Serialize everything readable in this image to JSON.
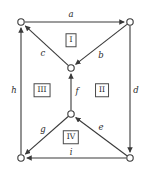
{
  "diagram": {
    "width": 148,
    "height": 172,
    "colors": {
      "stroke": "#3a3a3a",
      "background": "#ffffff",
      "text": "#2b2b2b",
      "box_border": "#4a4a4a"
    },
    "nodes": [
      {
        "id": "tl",
        "label": "",
        "x": 21,
        "y": 22,
        "r": 3.2
      },
      {
        "id": "tr",
        "label": "",
        "x": 130,
        "y": 22,
        "r": 3.2
      },
      {
        "id": "cu",
        "label": "",
        "x": 71,
        "y": 68,
        "r": 3.2
      },
      {
        "id": "cd",
        "label": "",
        "x": 71,
        "y": 114,
        "r": 3.2
      },
      {
        "id": "bl",
        "label": "",
        "x": 21,
        "y": 158,
        "r": 3.2
      },
      {
        "id": "br",
        "label": "",
        "x": 130,
        "y": 158,
        "r": 3.2
      }
    ],
    "edges": [
      {
        "id": "a",
        "label": "a",
        "from": "tl",
        "to": "tr",
        "label_x": 71,
        "label_y": 14
      },
      {
        "id": "b",
        "label": "b",
        "from": "tr",
        "to": "cu",
        "label_x": 101,
        "label_y": 55
      },
      {
        "id": "c",
        "label": "c",
        "from": "cu",
        "to": "tl",
        "label_x": 43,
        "label_y": 53
      },
      {
        "id": "d",
        "label": "d",
        "from": "tr",
        "to": "br",
        "label_x": 136,
        "label_y": 90
      },
      {
        "id": "e",
        "label": "e",
        "from": "br",
        "to": "cd",
        "label_x": 101,
        "label_y": 127
      },
      {
        "id": "f",
        "label": "f",
        "from": "cd",
        "to": "cu",
        "label_x": 77,
        "label_y": 91
      },
      {
        "id": "g",
        "label": "g",
        "from": "cd",
        "to": "bl",
        "label_x": 43,
        "label_y": 129
      },
      {
        "id": "h",
        "label": "h",
        "from": "bl",
        "to": "tl",
        "label_x": 14,
        "label_y": 90
      },
      {
        "id": "i",
        "label": "i",
        "from": "br",
        "to": "bl",
        "label_x": 71,
        "label_y": 152
      }
    ],
    "faces": [
      {
        "id": "face-1",
        "label": "I",
        "x": 71,
        "y": 40
      },
      {
        "id": "face-2",
        "label": "II",
        "x": 102,
        "y": 90
      },
      {
        "id": "face-3",
        "label": "III",
        "x": 42,
        "y": 90
      },
      {
        "id": "face-4",
        "label": "IV",
        "x": 71,
        "y": 137
      }
    ]
  }
}
